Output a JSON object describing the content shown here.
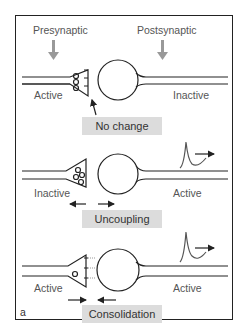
{
  "figure": {
    "panel_letter": "a",
    "header": {
      "presynaptic": "Presynaptic",
      "postsynaptic": "Postsynaptic"
    },
    "panels": [
      {
        "left_state": "Active",
        "right_state": "Inactive",
        "label": "No change"
      },
      {
        "left_state": "Inactive",
        "right_state": "Active",
        "label": "Uncoupling"
      },
      {
        "left_state": "Active",
        "right_state": "Active",
        "label": "Consolidation"
      }
    ],
    "colors": {
      "line": "#222222",
      "arrow_gray": "#999999",
      "label_bg": "#dcdcdc",
      "text": "#555555",
      "spike": "#555555"
    }
  }
}
